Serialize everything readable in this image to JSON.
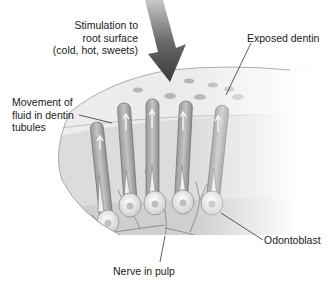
{
  "figure": {
    "labels": {
      "stimulation": "Stimulation to\nroot surface\n(cold, hot, sweets)",
      "exposed_dentin": "Exposed dentin",
      "fluid_movement": "Movement of\nfluid in dentin\ntubules",
      "odontoblast": "Odontoblast",
      "nerve": "Nerve in pulp"
    },
    "colors": {
      "arrow": "#4a4a4a",
      "dentin_surface": "#e6e6e6",
      "tubule": "#a8a8a8",
      "pulp": "#d9d9d9",
      "cell": "#f0f0f0",
      "leader_line": "#333333"
    },
    "tubule_count": 5
  }
}
